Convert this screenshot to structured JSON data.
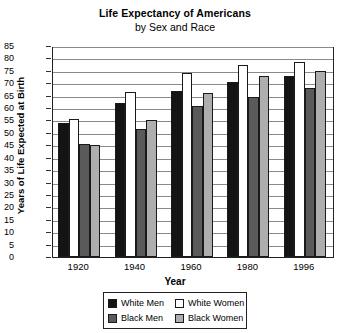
{
  "chart_data": {
    "type": "bar",
    "title": "Life Expectancy of Americans",
    "subtitle": "by Sex and Race",
    "xlabel": "Year",
    "ylabel": "Years of Life Expected at Birth",
    "categories": [
      "1920",
      "1940",
      "1960",
      "1980",
      "1996"
    ],
    "ylim": [
      0,
      85
    ],
    "ytick_step": 5,
    "yticks": [
      "0",
      "5",
      "10",
      "15",
      "20",
      "25",
      "30",
      "35",
      "40",
      "45",
      "50",
      "55",
      "60",
      "65",
      "70",
      "75",
      "80",
      "85"
    ],
    "grid": true,
    "legend_position": "bottom-center",
    "series": [
      {
        "name": "White Men",
        "color": "#141414",
        "values": [
          54,
          62,
          67,
          70.5,
          73
        ]
      },
      {
        "name": "White Women",
        "color": "#ffffff",
        "values": [
          55.5,
          66.5,
          74,
          77.5,
          78.5
        ]
      },
      {
        "name": "Black Men",
        "color": "#5a5a5a",
        "values": [
          45.5,
          51.5,
          61,
          64.5,
          68
        ]
      },
      {
        "name": "Black Women",
        "color": "#aeaeae",
        "values": [
          45,
          55,
          66,
          73,
          75
        ]
      }
    ]
  },
  "legend": {
    "items": [
      {
        "label": "White Men"
      },
      {
        "label": "White Women"
      },
      {
        "label": "Black Men"
      },
      {
        "label": "Black Women"
      }
    ]
  }
}
